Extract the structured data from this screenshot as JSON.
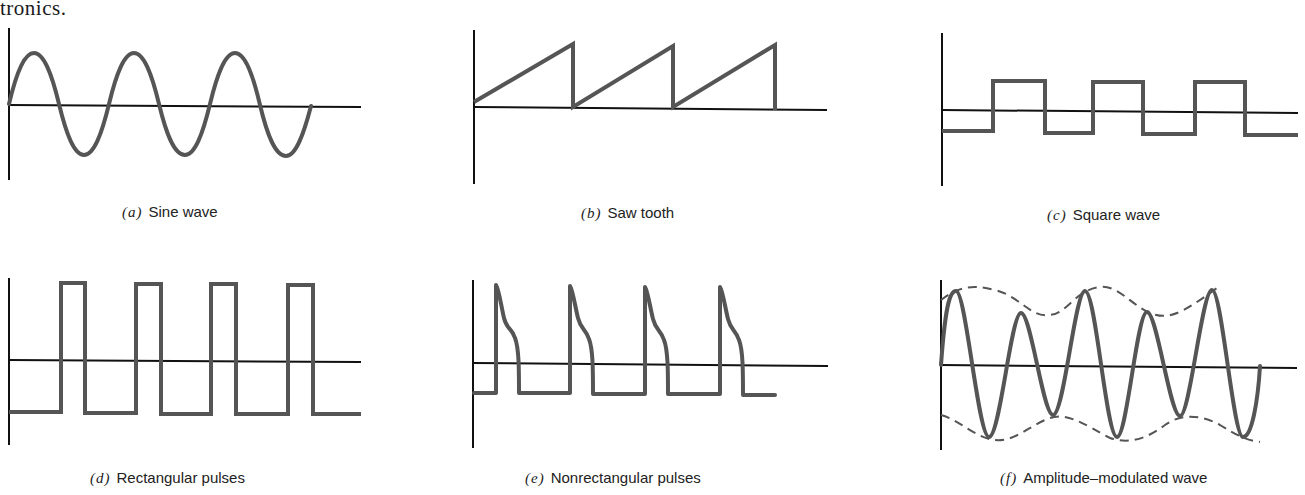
{
  "page": {
    "top_fragment": "tronics."
  },
  "figures": [
    {
      "id": "a",
      "tag": "(a)",
      "title": "Sine wave"
    },
    {
      "id": "b",
      "tag": "(b)",
      "title": "Saw tooth"
    },
    {
      "id": "c",
      "tag": "(c)",
      "title": "Square wave"
    },
    {
      "id": "d",
      "tag": "(d)",
      "title": "Rectangular pulses"
    },
    {
      "id": "e",
      "tag": "(e)",
      "title": "Nonrectangular pulses"
    },
    {
      "id": "f",
      "tag": "(f)",
      "title": "Amplitude–modulated wave"
    }
  ],
  "colors": {
    "axis": "#111111",
    "waveform": "#555555",
    "background": "#ffffff"
  }
}
